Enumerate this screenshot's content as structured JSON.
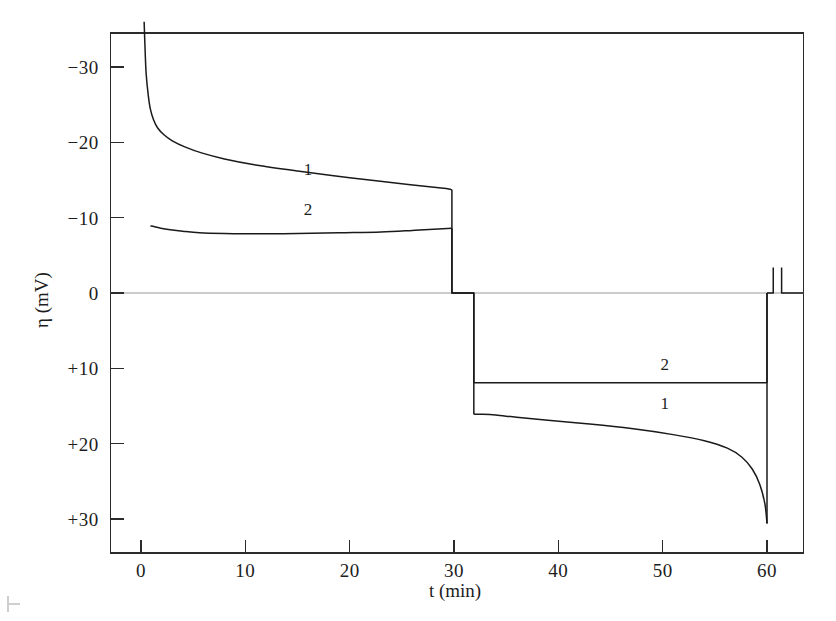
{
  "chart_data": {
    "type": "line",
    "title": "",
    "xlabel": "t (min)",
    "ylabel": "η (mV)",
    "xlim": [
      -2.9,
      63.5
    ],
    "ylim_top_value": -34.5,
    "ylim_bottom_value": 34.5,
    "y_inverted": true,
    "grid": false,
    "legend": "inline-curve-labels",
    "xticks": [
      0,
      10,
      20,
      30,
      40,
      50,
      60
    ],
    "xtick_labels": [
      "0",
      "10",
      "20",
      "30",
      "40",
      "50",
      "60"
    ],
    "yticks": [
      -30,
      -20,
      -10,
      0,
      10,
      20,
      30
    ],
    "ytick_labels": [
      "−30",
      "−20",
      "−10",
      "0",
      "+10",
      "+20",
      "+30"
    ],
    "zero_reference_line": 0,
    "annotations": [
      {
        "text": "1",
        "x": 16.0,
        "y": -15.6,
        "note": "label for curve 1, cathodic branch"
      },
      {
        "text": "2",
        "x": 16.0,
        "y": -10.4,
        "note": "label for curve 2, cathodic branch"
      },
      {
        "text": "2",
        "x": 50.2,
        "y": 10.2,
        "note": "label for curve 2, anodic branch"
      },
      {
        "text": "1",
        "x": 50.2,
        "y": 15.4,
        "note": "label for curve 1, anodic branch"
      }
    ],
    "series": [
      {
        "name": "1",
        "label": "1",
        "color": "#1a1a1a",
        "points_cathodic": [
          [
            0.3,
            -36.0
          ],
          [
            0.4,
            -32.0
          ],
          [
            0.5,
            -29.0
          ],
          [
            0.7,
            -26.2
          ],
          [
            0.9,
            -24.4
          ],
          [
            1.2,
            -23.0
          ],
          [
            1.6,
            -21.9
          ],
          [
            2.2,
            -21.0
          ],
          [
            3.0,
            -20.2
          ],
          [
            4.2,
            -19.4
          ],
          [
            5.8,
            -18.6
          ],
          [
            8.0,
            -17.8
          ],
          [
            11.0,
            -17.0
          ],
          [
            15.0,
            -16.2
          ],
          [
            20.0,
            -15.3
          ],
          [
            25.0,
            -14.5
          ],
          [
            29.0,
            -13.9
          ],
          [
            29.8,
            -13.7
          ]
        ],
        "zero_interval": [
          29.8,
          31.9
        ],
        "points_anodic": [
          [
            31.9,
            16.1
          ],
          [
            32.6,
            16.1
          ],
          [
            34.0,
            16.2
          ],
          [
            36.0,
            16.5
          ],
          [
            39.0,
            16.9
          ],
          [
            43.0,
            17.4
          ],
          [
            47.0,
            18.0
          ],
          [
            51.0,
            18.8
          ],
          [
            54.0,
            19.6
          ],
          [
            56.2,
            20.6
          ],
          [
            57.6,
            21.8
          ],
          [
            58.6,
            23.4
          ],
          [
            59.3,
            25.4
          ],
          [
            59.8,
            28.0
          ],
          [
            60.0,
            30.6
          ]
        ],
        "return_to_zero_at": 60.0
      },
      {
        "name": "2",
        "label": "2",
        "color": "#1a1a1a",
        "points_cathodic": [
          [
            0.9,
            -8.9
          ],
          [
            1.3,
            -8.8
          ],
          [
            1.9,
            -8.6
          ],
          [
            2.8,
            -8.4
          ],
          [
            4.0,
            -8.2
          ],
          [
            5.6,
            -8.0
          ],
          [
            8.0,
            -7.9
          ],
          [
            11.0,
            -7.85
          ],
          [
            15.0,
            -7.9
          ],
          [
            19.0,
            -8.0
          ],
          [
            23.0,
            -8.1
          ],
          [
            26.0,
            -8.3
          ],
          [
            28.5,
            -8.5
          ],
          [
            29.8,
            -8.6
          ]
        ],
        "zero_interval": [
          29.8,
          31.9
        ],
        "points_anodic": [
          [
            31.9,
            11.9
          ],
          [
            34.0,
            11.9
          ],
          [
            38.0,
            11.9
          ],
          [
            43.0,
            11.9
          ],
          [
            48.0,
            11.9
          ],
          [
            53.0,
            11.9
          ],
          [
            57.0,
            11.9
          ],
          [
            59.5,
            11.9
          ],
          [
            60.0,
            11.9
          ]
        ],
        "return_to_zero_at": 60.0
      }
    ],
    "post_pulse_notch": {
      "description": "brief downward excursion from zero just after t = 60 min",
      "x_start": 60.6,
      "x_end": 61.4,
      "depth_mv": -3.4
    }
  },
  "figure": {
    "axis_y_title": "η (mV)",
    "axis_x_title": "t (min)"
  }
}
